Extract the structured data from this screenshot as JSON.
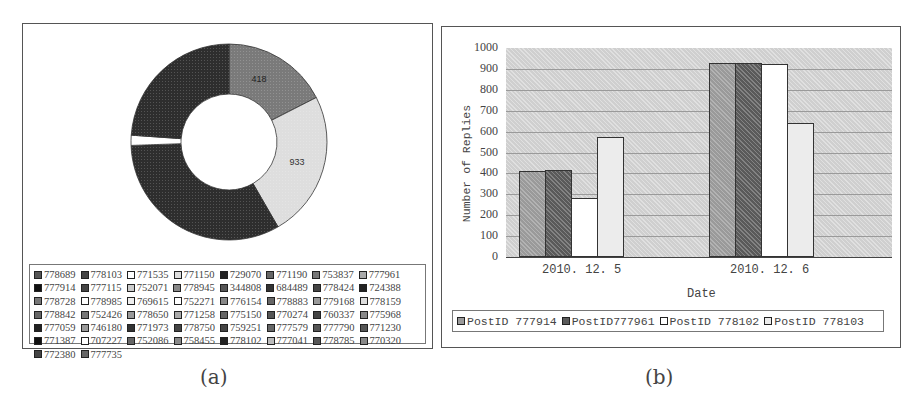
{
  "captions": {
    "a": "(a)",
    "b": "(b)"
  },
  "colors": {
    "s1": "#9a9a9a",
    "s2": "#5a5a5a",
    "s3": "#ffffff",
    "s4": "#ececec",
    "donut_dark": "#2e2e2e",
    "donut_mid": "#7a7a7a",
    "donut_light": "#dedede"
  },
  "pie_legend": [
    "778689",
    "778103",
    "771535",
    "771150",
    "729070",
    "771190",
    "753837",
    "777961",
    "777914",
    "777115",
    "752071",
    "778945",
    "344808",
    "684489",
    "778424",
    "724388",
    "778728",
    "778985",
    "769615",
    "752271",
    "776154",
    "778883",
    "779168",
    "778159",
    "778842",
    "752426",
    "778650",
    "771258",
    "775150",
    "770274",
    "760337",
    "775968",
    "777059",
    "746180",
    "771973",
    "778750",
    "759251",
    "777579",
    "777790",
    "771230",
    "771387",
    "707227",
    "752086",
    "758455",
    "778102",
    "777041",
    "778785",
    "770320",
    "772380",
    "777735"
  ],
  "pie_swatches": [
    "#555",
    "#444",
    "#fff",
    "#ddd",
    "#222",
    "#666",
    "#777",
    "#aaa",
    "#111",
    "#444",
    "#ccc",
    "#888",
    "#555",
    "#333",
    "#444",
    "#222",
    "#777",
    "#fff",
    "#eee",
    "#fff",
    "#888",
    "#666",
    "#999",
    "#ddd",
    "#666",
    "#777",
    "#999",
    "#aaa",
    "#666",
    "#555",
    "#444",
    "#888",
    "#222",
    "#999",
    "#333",
    "#444",
    "#444",
    "#666",
    "#555",
    "#555",
    "#111",
    "#fff",
    "#666",
    "#888",
    "#222",
    "#bbb",
    "#555",
    "#888",
    "#444",
    "#666"
  ],
  "chart_data": [
    {
      "type": "pie",
      "variant": "donut",
      "title": "",
      "labels_visible": [
        "418",
        "933"
      ],
      "slices": [
        {
          "label": "778103 (top-right)",
          "value": 418,
          "start_deg": 0,
          "end_deg": 63
        },
        {
          "label": "778102 (right)",
          "value": 933,
          "start_deg": 63,
          "end_deg": 150
        },
        {
          "label": "dark (bottom-left)",
          "value": null,
          "start_deg": 150,
          "end_deg": 268
        },
        {
          "label": "small slices",
          "value": null,
          "start_deg": 268,
          "end_deg": 274
        },
        {
          "label": "dark (top-left)",
          "value": null,
          "start_deg": 274,
          "end_deg": 360
        }
      ],
      "legend": "50 PostIDs (see pie_legend)",
      "legend_position": "bottom"
    },
    {
      "type": "bar",
      "title": "",
      "xlabel": "Date",
      "ylabel": "Number of Replies",
      "categories": [
        "2010.12.5",
        "2010.12.6"
      ],
      "series": [
        {
          "name": "PostID 777914",
          "values": [
            413,
            930
          ]
        },
        {
          "name": "PostID777961",
          "values": [
            418,
            930
          ]
        },
        {
          "name": "PostID 778102",
          "values": [
            280,
            923
          ]
        },
        {
          "name": "PostID 778103",
          "values": [
            572,
            639
          ]
        }
      ],
      "ylim": [
        0,
        1000
      ],
      "yticks": [
        0,
        100,
        200,
        300,
        400,
        500,
        600,
        700,
        800,
        900,
        1000
      ],
      "grid": true,
      "legend_position": "bottom"
    }
  ],
  "bar": {
    "yticks": [
      "1000",
      "900",
      "800",
      "700",
      "600",
      "500",
      "400",
      "300",
      "200",
      "100",
      "0"
    ],
    "ylabel": "Number of Replies",
    "xlabel": "Date",
    "xticks": [
      "2010. 12. 5",
      "2010. 12. 6"
    ],
    "legend": [
      "PostID 777914",
      "PostID777961",
      "PostID 778102",
      "PostID 778103"
    ]
  }
}
